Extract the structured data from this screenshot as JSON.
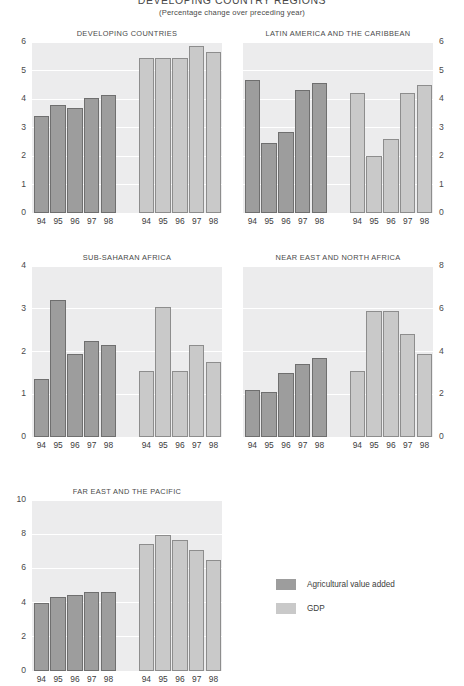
{
  "header": {
    "title": "DEVELOPING COUNTRY REGIONS",
    "subtitle": "(Percentage change over preceding year)"
  },
  "legend": {
    "items": [
      {
        "label": "Agricultural value added",
        "color": "#9d9d9d",
        "key": "agri"
      },
      {
        "label": "GDP",
        "color": "#c9c9c9",
        "key": "gdp"
      }
    ]
  },
  "colors": {
    "agricultural_value_added": "#9d9d9d",
    "gdp": "#c9c9c9",
    "plot_background": "#ececed",
    "gridline": "#ffffff",
    "text": "#3c3c3c"
  },
  "chart_data": [
    {
      "type": "bar",
      "title": "DEVELOPING COUNTRIES",
      "categories": [
        "94",
        "95",
        "96",
        "97",
        "98"
      ],
      "series": [
        {
          "name": "Agricultural value added",
          "values": [
            3.4,
            3.8,
            3.7,
            4.05,
            4.15
          ]
        },
        {
          "name": "GDP",
          "values": [
            5.45,
            5.45,
            5.45,
            5.85,
            5.65
          ]
        }
      ],
      "ylim": [
        0,
        6
      ],
      "yticks": [
        0,
        1,
        2,
        3,
        4,
        5,
        6
      ],
      "axis_side": "left",
      "xlabel": "",
      "ylabel": "",
      "grid": true
    },
    {
      "type": "bar",
      "title": "LATIN AMERICA AND THE CARIBBEAN",
      "categories": [
        "94",
        "95",
        "96",
        "97",
        "98"
      ],
      "series": [
        {
          "name": "Agricultural value added",
          "values": [
            4.65,
            2.45,
            2.85,
            4.3,
            4.55
          ]
        },
        {
          "name": "GDP",
          "values": [
            4.2,
            2.0,
            2.6,
            4.2,
            4.5
          ]
        }
      ],
      "ylim": [
        0,
        6
      ],
      "yticks": [
        0,
        1,
        2,
        3,
        4,
        5,
        6
      ],
      "axis_side": "right",
      "xlabel": "",
      "ylabel": "",
      "grid": true
    },
    {
      "type": "bar",
      "title": "SUB-SAHARAN AFRICA",
      "categories": [
        "94",
        "95",
        "96",
        "97",
        "98"
      ],
      "series": [
        {
          "name": "Agricultural value added",
          "values": [
            1.35,
            3.2,
            1.95,
            2.25,
            2.15
          ]
        },
        {
          "name": "GDP",
          "values": [
            1.55,
            3.05,
            1.55,
            2.15,
            1.75
          ]
        }
      ],
      "ylim": [
        0,
        4
      ],
      "yticks": [
        0,
        1,
        2,
        3,
        4
      ],
      "axis_side": "left",
      "xlabel": "",
      "ylabel": "",
      "grid": true
    },
    {
      "type": "bar",
      "title": "NEAR EAST AND NORTH AFRICA",
      "categories": [
        "94",
        "95",
        "96",
        "97",
        "98"
      ],
      "series": [
        {
          "name": "Agricultural value added",
          "values": [
            1.1,
            1.05,
            1.5,
            1.7,
            1.85
          ]
        },
        {
          "name": "GDP",
          "values": [
            1.55,
            2.95,
            2.95,
            2.4,
            1.95
          ]
        }
      ],
      "ylim": [
        0,
        4
      ],
      "yticks_right": [
        0,
        2,
        4,
        6,
        8
      ],
      "right_axis_scale": [
        0,
        8
      ],
      "axis_side": "right",
      "xlabel": "",
      "ylabel": "",
      "grid": true
    },
    {
      "type": "bar",
      "title": "FAR EAST AND THE PACIFIC",
      "categories": [
        "94",
        "95",
        "96",
        "97",
        "98"
      ],
      "series": [
        {
          "name": "Agricultural value added",
          "values": [
            4.0,
            4.35,
            4.45,
            4.6,
            4.6
          ]
        },
        {
          "name": "GDP",
          "values": [
            7.45,
            7.95,
            7.65,
            7.1,
            6.5
          ]
        }
      ],
      "ylim": [
        0,
        10
      ],
      "yticks": [
        0,
        2,
        4,
        6,
        8,
        10
      ],
      "axis_side": "left",
      "xlabel": "",
      "ylabel": "",
      "grid": true,
      "clipped_bottom": true
    }
  ]
}
